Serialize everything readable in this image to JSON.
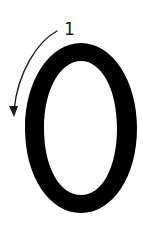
{
  "diagram": {
    "type": "stroke-order",
    "character": "0",
    "strokes": [
      {
        "number": "1",
        "direction": "counter-clockwise",
        "start": "top"
      }
    ],
    "colors": {
      "glyph": "#000000",
      "arrow": "#1a1a1a",
      "background": "#ffffff"
    }
  }
}
